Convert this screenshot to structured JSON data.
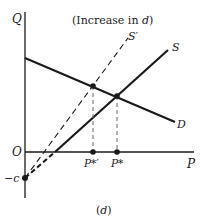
{
  "diagram": {
    "title": "(Increase in d)",
    "title_prefix": "(Increase in ",
    "title_var": "d",
    "title_suffix": ")",
    "caption": "(d)",
    "axes": {
      "y_label": "Q",
      "x_label": "P",
      "origin_label": "O",
      "intercept_label": "−c"
    },
    "curves": {
      "demand_label": "D",
      "supply_label": "S",
      "supply_shifted_label": "S′"
    },
    "points": {
      "equilibrium_new_label": "P*′",
      "equilibrium_old_label": "P*"
    },
    "colors": {
      "line": "#1a1a1a",
      "dashed_guide": "#666666",
      "background": "#ffffff"
    }
  }
}
